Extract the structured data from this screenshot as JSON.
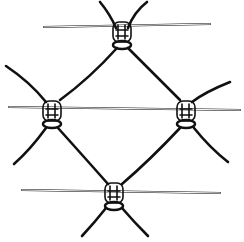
{
  "image": {
    "subject": "wire-mesh-illustration",
    "background": "#ffffff",
    "ink": "#111111",
    "knots": [
      {
        "name": "top",
        "x": 122,
        "y": 36
      },
      {
        "name": "left",
        "x": 52,
        "y": 115
      },
      {
        "name": "right",
        "x": 186,
        "y": 115
      },
      {
        "name": "bottom",
        "x": 114,
        "y": 196
      }
    ]
  }
}
